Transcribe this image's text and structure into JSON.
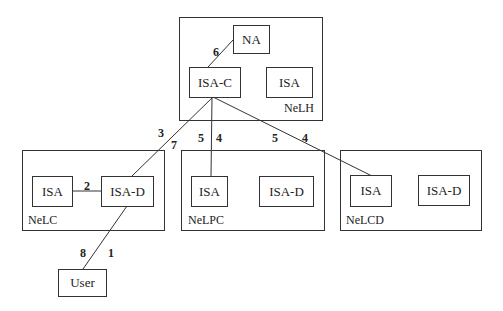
{
  "groups": [
    {
      "id": "NeLH",
      "label": "NeLH"
    },
    {
      "id": "NeLC",
      "label": "NeLC"
    },
    {
      "id": "NeLPC",
      "label": "NeLPC"
    },
    {
      "id": "NeLCD",
      "label": "NeLCD"
    }
  ],
  "nodes": {
    "na": "NA",
    "nelh_isa_c": "ISA-C",
    "nelh_isa": "ISA",
    "nelc_isa": "ISA",
    "nelc_isa_d": "ISA-D",
    "nelpc_isa": "ISA",
    "nelpc_isa_d": "ISA-D",
    "nelcd_isa": "ISA",
    "nelcd_isa_d": "ISA-D",
    "user": "User"
  },
  "edge_labels": {
    "e1": "1",
    "e2": "2",
    "e3": "3",
    "e4a": "4",
    "e4b": "4",
    "e5a": "5",
    "e5b": "5",
    "e6": "6",
    "e7": "7",
    "e8": "8"
  },
  "edges": [
    {
      "from": "User",
      "to": "ISA-D (NeLC)",
      "labels": [
        "8",
        "1"
      ]
    },
    {
      "from": "ISA (NeLC)",
      "to": "ISA-D (NeLC)",
      "labels": [
        "2"
      ]
    },
    {
      "from": "ISA-D (NeLC)",
      "to": "ISA-C",
      "labels": [
        "3",
        "7"
      ]
    },
    {
      "from": "ISA-C",
      "to": "ISA (NeLPC)",
      "labels": [
        "5",
        "4"
      ]
    },
    {
      "from": "ISA-C",
      "to": "ISA (NeLCD)",
      "labels": [
        "5",
        "4"
      ]
    },
    {
      "from": "ISA-C",
      "to": "NA",
      "labels": [
        "6"
      ]
    }
  ]
}
